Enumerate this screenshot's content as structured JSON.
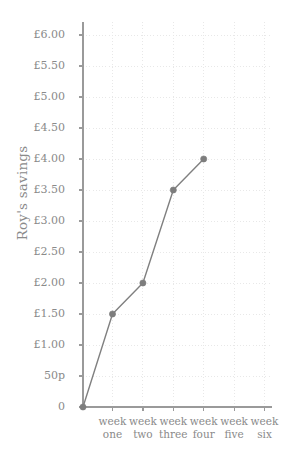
{
  "chart_data": {
    "type": "line",
    "title": "",
    "xlabel": "",
    "ylabel": "Roy's savings",
    "categories": [
      "week one",
      "week two",
      "week three",
      "week four",
      "week five",
      "week six"
    ],
    "x_tick_lines": [
      [
        "week",
        "one"
      ],
      [
        "week",
        "two"
      ],
      [
        "week",
        "three"
      ],
      [
        "week",
        "four"
      ],
      [
        "week",
        "five"
      ],
      [
        "week",
        "six"
      ]
    ],
    "series": [
      {
        "name": "Roy's savings",
        "values": [
          1.5,
          2.0,
          3.5,
          4.0,
          null,
          null
        ]
      }
    ],
    "origin_point": {
      "label": "0",
      "value": 0
    },
    "y_tick_labels": [
      "0",
      "50p",
      "£1.00",
      "£1.50",
      "£2.00",
      "£2.50",
      "£3.00",
      "£3.50",
      "£4.00",
      "£4.50",
      "£5.00",
      "£5.50",
      "£6.00"
    ],
    "y_tick_values": [
      0,
      0.5,
      1.0,
      1.5,
      2.0,
      2.5,
      3.0,
      3.5,
      4.0,
      4.5,
      5.0,
      5.5,
      6.0
    ],
    "ylim": [
      0,
      6.0
    ],
    "y_unit": "GBP",
    "grid": true,
    "grid_style": "dotted",
    "legend": "none",
    "colors": {
      "line": "#808080",
      "marker": "#7d7d7d",
      "grid": "#e8e8e8",
      "axis": "#9a9a9a",
      "text": "#8a8a8a",
      "background": "#ffffff"
    }
  }
}
